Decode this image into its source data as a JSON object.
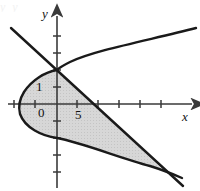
{
  "figure": {
    "title_fragment": "y",
    "background_color": "#ffffff",
    "curve_color": "#1a1a1a",
    "axis_color": "#3a3a3a",
    "shade_color": "#d7d7d7",
    "shade_edge_color": "#1a1a1a"
  },
  "axes": {
    "x_label": "x",
    "y_label": "y",
    "origin_label": "0",
    "origin": {
      "x": 57,
      "y": 104
    },
    "x_tick_spacing": 21,
    "y_tick_spacing": 17,
    "x_axis_start": 8,
    "x_axis_end": 192,
    "y_axis_top": 16,
    "y_axis_bottom": 188,
    "x_ticks": [
      14,
      35,
      77,
      98,
      119,
      140,
      161
    ],
    "y_ticks": [
      36,
      53,
      70,
      87,
      121,
      138,
      155,
      172
    ]
  },
  "labels": [
    {
      "text": "1",
      "x": 36,
      "y": 80,
      "kind": "num"
    },
    {
      "text": "0",
      "x": 38,
      "y": 106,
      "kind": "num"
    },
    {
      "text": "5",
      "x": 75,
      "y": 108,
      "kind": "num"
    }
  ],
  "curves": {
    "parabola": {
      "name": "rightward-parabola",
      "vertex": {
        "x": 20,
        "y": 104
      },
      "upper_end": {
        "x": 196,
        "y": 28
      },
      "lower_end": {
        "x": 182,
        "y": 178
      },
      "path": "M 196 28 C 150 40 95 50 70 62 C 62 66 58 69 57 70 C 45 72 32 80 24 92 C 19 100 18 106 20 114 C 25 128 42 136 57 138 C 80 142 120 158 150 166 C 163 170 175 175 182 178"
    },
    "line": {
      "name": "descending-line",
      "start": {
        "x": 11,
        "y": 28
      },
      "end": {
        "x": 183,
        "y": 186
      },
      "path": "M 11 28 L 183 186"
    }
  },
  "shaded_region": {
    "name": "region-between-parabola-and-line",
    "path": "M 57 70 C 45 72 32 80 24 92 C 19 100 18 106 20 114 C 25 128 42 136 57 138 C 80 142 120 158 150 166 C 157 168 161 169 164 171 L 57 70 Z"
  },
  "top_partial_text": "y                 y"
}
